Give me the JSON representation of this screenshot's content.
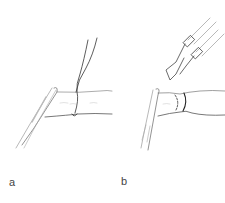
{
  "figure": {
    "panels": [
      {
        "id": "a",
        "label": "a",
        "description": "Clamp holding vessel end with suture loop tied around vessel"
      },
      {
        "id": "b",
        "label": "b",
        "description": "Forceps approaching ligated vessel end held by clamp; dashed line marks cut"
      }
    ],
    "colors": {
      "line": "#333333",
      "shade": "#bbbbbb",
      "background": "#ffffff"
    }
  }
}
